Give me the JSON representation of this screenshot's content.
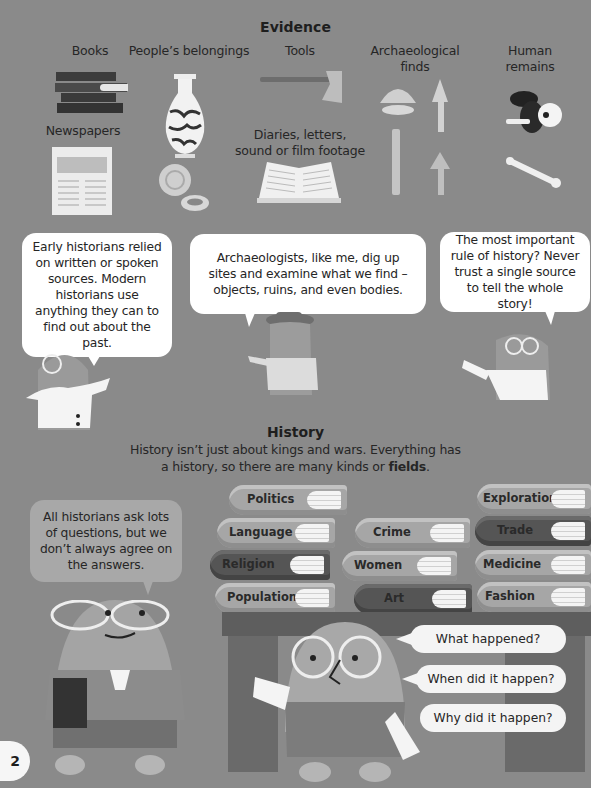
{
  "evidence": {
    "title": "Evidence",
    "categories": [
      {
        "id": "books",
        "label": "Books"
      },
      {
        "id": "belongings",
        "label": "People’s belongings"
      },
      {
        "id": "tools",
        "label": "Tools"
      },
      {
        "id": "archaeological",
        "label": "Archaeological finds"
      },
      {
        "id": "human_remains",
        "label": "Human remains"
      },
      {
        "id": "newspapers",
        "label": "Newspapers"
      },
      {
        "id": "diaries",
        "label": "Diaries, letters, sound or film footage"
      }
    ]
  },
  "speech": {
    "early_historians": "Early historians relied on written or spoken sources. Modern historians use anything they can to find out about the past.",
    "archaeologists": "Archaeologists, like me, dig up sites and examine what we find – objects, ruins, and even bodies.",
    "important_rule": "The most important rule of history? Never trust a single source to tell the whole story!",
    "questions": "All historians ask lots of questions, but we don’t always agree on the answers."
  },
  "history": {
    "title": "History",
    "intro_1": "History isn’t just about kings and wars. Everything has",
    "intro_2": "a history, so there are many kinds or ",
    "intro_bold": "fields",
    "intro_end": "."
  },
  "fields": {
    "stack1": [
      "Politics",
      "Language",
      "Religion",
      "Population"
    ],
    "stack2": [
      "Crime",
      "Women",
      "Art"
    ],
    "stack3": [
      "Exploration",
      "Trade",
      "Medicine",
      "Fashion"
    ]
  },
  "questions": [
    "What happened?",
    "When did it happen?",
    "Why did it happen?"
  ],
  "page_number": "2"
}
